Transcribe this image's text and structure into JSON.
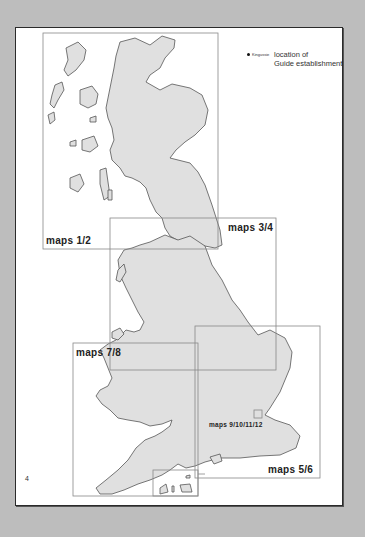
{
  "legend": {
    "example_town": "Kingussie",
    "line1": "location of",
    "line2": "Guide establishment"
  },
  "map_regions": [
    {
      "label": "maps 1/2",
      "box": [
        43,
        33,
        218,
        249
      ]
    },
    {
      "label": "maps 3/4",
      "box": [
        110,
        218,
        276,
        370
      ]
    },
    {
      "label": "maps 5/6",
      "box": [
        195,
        326,
        320,
        478
      ]
    },
    {
      "label": "maps 7/8",
      "box": [
        73,
        343,
        198,
        496
      ]
    },
    {
      "label": "maps 9/10/11/12",
      "box": [
        254,
        410,
        262,
        418
      ]
    }
  ],
  "page_number": "4",
  "colors": {
    "land": "#e0e0e0",
    "coast": "#555555",
    "box": "#888888",
    "background": "#bdbdbd",
    "page": "#ffffff"
  }
}
